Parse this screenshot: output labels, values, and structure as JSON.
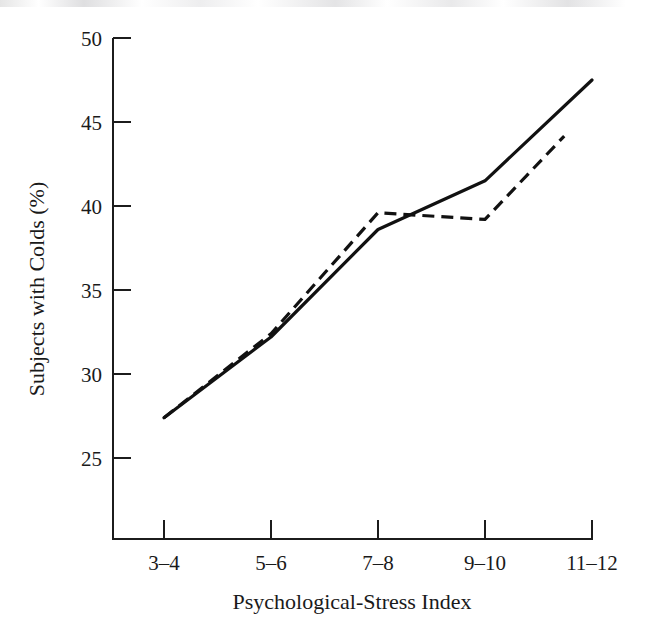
{
  "figure": {
    "background_color": "#ffffff",
    "ink_color": "#111111"
  },
  "chart_data": {
    "type": "line",
    "title": "",
    "xlabel": "Psychological-Stress Index",
    "ylabel": "Subjects with Colds (%)",
    "categories": [
      "3–4",
      "5–6",
      "7–8",
      "9–10",
      "11–12"
    ],
    "ytick_labels": [
      "25",
      "30",
      "35",
      "40",
      "45",
      "50"
    ],
    "ytick_values": [
      25,
      30,
      35,
      40,
      45,
      50
    ],
    "ylim": [
      23.0,
      50.0
    ],
    "xlim": [
      0,
      4
    ],
    "grid": false,
    "legend": "none",
    "series": [
      {
        "name": "solid-line",
        "style": "solid",
        "color": "#111111",
        "x": [
          "3–4",
          "5–6",
          "7–8",
          "9–10",
          "11–12"
        ],
        "values": [
          27.4,
          32.2,
          38.6,
          41.5,
          47.5
        ]
      },
      {
        "name": "dashed-line",
        "style": "dashed",
        "color": "#111111",
        "x": [
          "3–4",
          "5–6",
          "7–8",
          "9–10",
          "11–12"
        ],
        "values": [
          27.4,
          32.4,
          39.6,
          39.2,
          45.9
        ]
      }
    ]
  },
  "axes": {
    "y_ticks": [
      {
        "label": "50",
        "value": 50
      },
      {
        "label": "45",
        "value": 45
      },
      {
        "label": "40",
        "value": 40
      },
      {
        "label": "35",
        "value": 35
      },
      {
        "label": "30",
        "value": 30
      },
      {
        "label": "25",
        "value": 25
      }
    ],
    "x_ticks": [
      {
        "label": "3–4",
        "index": 0
      },
      {
        "label": "5–6",
        "index": 1
      },
      {
        "label": "7–8",
        "index": 2
      },
      {
        "label": "9–10",
        "index": 3
      },
      {
        "label": "11–12",
        "index": 4
      }
    ],
    "y_axis_title": "Subjects with Colds (%)",
    "x_axis_title": "Psychological-Stress Index"
  }
}
